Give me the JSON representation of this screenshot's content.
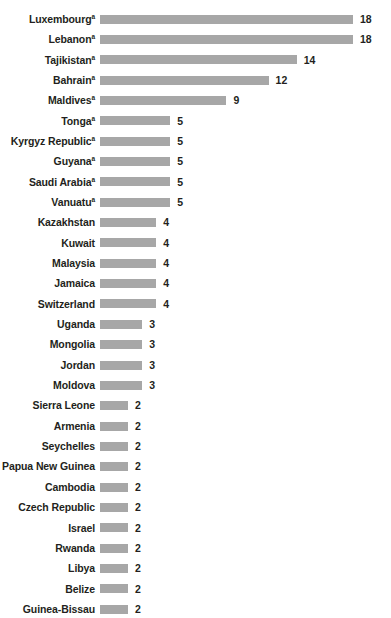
{
  "chart": {
    "type": "bar",
    "orientation": "horizontal",
    "bar_color": "#a7a7a7",
    "text_color": "#231f20",
    "background": "#ffffff",
    "footnote_marker": "a",
    "px_per_unit": 14.05,
    "bar_start_px": 105
  },
  "chart_data": {
    "type": "bar",
    "title": "",
    "xlabel": "",
    "ylabel": "",
    "orientation": "horizontal",
    "grid": false,
    "legend": "none",
    "xlim": [
      0,
      18
    ],
    "categories": [
      "Luxembourg",
      "Lebanon",
      "Tajikistan",
      "Bahrain",
      "Maldives",
      "Tonga",
      "Kyrgyz Republic",
      "Guyana",
      "Saudi Arabia",
      "Vanuatu",
      "Kazakhstan",
      "Kuwait",
      "Malaysia",
      "Jamaica",
      "Switzerland",
      "Uganda",
      "Mongolia",
      "Jordan",
      "Moldova",
      "Sierra Leone",
      "Armenia",
      "Seychelles",
      "Papua New Guinea",
      "Cambodia",
      "Czech Republic",
      "Israel",
      "Rwanda",
      "Libya",
      "Belize",
      "Guinea-Bissau"
    ],
    "values": [
      18,
      18,
      14,
      12,
      9,
      5,
      5,
      5,
      5,
      5,
      4,
      4,
      4,
      4,
      4,
      3,
      3,
      3,
      3,
      2,
      2,
      2,
      2,
      2,
      2,
      2,
      2,
      2,
      2,
      2
    ]
  },
  "rows": [
    {
      "label": "Luxembourg",
      "sup": "a",
      "value": 18,
      "value_text": "18"
    },
    {
      "label": "Lebanon",
      "sup": "a",
      "value": 18,
      "value_text": "18"
    },
    {
      "label": "Tajikistan",
      "sup": "a",
      "value": 14,
      "value_text": "14"
    },
    {
      "label": "Bahrain",
      "sup": "a",
      "value": 12,
      "value_text": "12"
    },
    {
      "label": "Maldives",
      "sup": "a",
      "value": 9,
      "value_text": "9"
    },
    {
      "label": "Tonga",
      "sup": "a",
      "value": 5,
      "value_text": "5"
    },
    {
      "label": "Kyrgyz Republic",
      "sup": "a",
      "value": 5,
      "value_text": "5"
    },
    {
      "label": "Guyana",
      "sup": "a",
      "value": 5,
      "value_text": "5"
    },
    {
      "label": "Saudi Arabia",
      "sup": "a",
      "value": 5,
      "value_text": "5"
    },
    {
      "label": "Vanuatu",
      "sup": "a",
      "value": 5,
      "value_text": "5"
    },
    {
      "label": "Kazakhstan",
      "sup": "",
      "value": 4,
      "value_text": "4"
    },
    {
      "label": "Kuwait",
      "sup": "",
      "value": 4,
      "value_text": "4"
    },
    {
      "label": "Malaysia",
      "sup": "",
      "value": 4,
      "value_text": "4"
    },
    {
      "label": "Jamaica",
      "sup": "",
      "value": 4,
      "value_text": "4"
    },
    {
      "label": "Switzerland",
      "sup": "",
      "value": 4,
      "value_text": "4"
    },
    {
      "label": "Uganda",
      "sup": "",
      "value": 3,
      "value_text": "3"
    },
    {
      "label": "Mongolia",
      "sup": "",
      "value": 3,
      "value_text": "3"
    },
    {
      "label": "Jordan",
      "sup": "",
      "value": 3,
      "value_text": "3"
    },
    {
      "label": "Moldova",
      "sup": "",
      "value": 3,
      "value_text": "3"
    },
    {
      "label": "Sierra Leone",
      "sup": "",
      "value": 2,
      "value_text": "2"
    },
    {
      "label": "Armenia",
      "sup": "",
      "value": 2,
      "value_text": "2"
    },
    {
      "label": "Seychelles",
      "sup": "",
      "value": 2,
      "value_text": "2"
    },
    {
      "label": "Papua New Guinea",
      "sup": "",
      "value": 2,
      "value_text": "2"
    },
    {
      "label": "Cambodia",
      "sup": "",
      "value": 2,
      "value_text": "2"
    },
    {
      "label": "Czech Republic",
      "sup": "",
      "value": 2,
      "value_text": "2"
    },
    {
      "label": "Israel",
      "sup": "",
      "value": 2,
      "value_text": "2"
    },
    {
      "label": "Rwanda",
      "sup": "",
      "value": 2,
      "value_text": "2"
    },
    {
      "label": "Libya",
      "sup": "",
      "value": 2,
      "value_text": "2"
    },
    {
      "label": "Belize",
      "sup": "",
      "value": 2,
      "value_text": "2"
    },
    {
      "label": "Guinea-Bissau",
      "sup": "",
      "value": 2,
      "value_text": "2"
    }
  ]
}
